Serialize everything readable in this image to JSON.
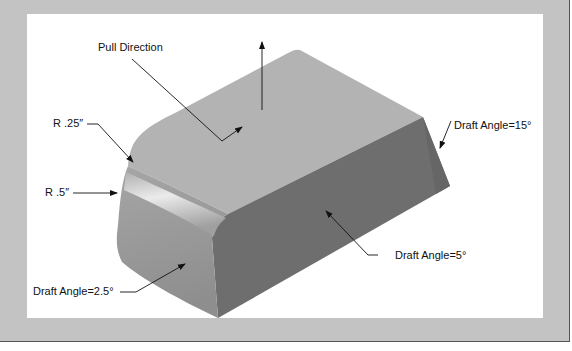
{
  "figure": {
    "labels": {
      "pull_direction": "Pull Direction",
      "radius_small": "R .25″",
      "radius_large": "R .5″",
      "draft_front": "Draft Angle=2.5°",
      "draft_side": "Draft Angle=5°",
      "draft_end": "Draft Angle=15°"
    },
    "colors": {
      "frame": "#c3c3c3",
      "panel": "#ffffff",
      "top_face": "#b3b3b3",
      "front_face": "#9a9a9a",
      "side_face": "#6e6e6e",
      "end_face": "#6a6a6a",
      "leader": "#111111"
    }
  }
}
